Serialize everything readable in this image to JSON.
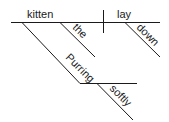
{
  "diagram": {
    "type": "sentence-diagram",
    "subject": "kitten",
    "predicate": "lay",
    "modifiers": {
      "subject_article": "the",
      "subject_participle": "Purring",
      "participle_adverb": "softly",
      "predicate_adverb": "down"
    },
    "colors": {
      "line": "#1a1a1a",
      "text": "#1a1a1a",
      "background": "#ffffff"
    }
  }
}
